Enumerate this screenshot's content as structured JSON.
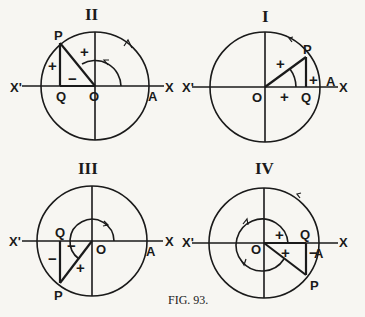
{
  "caption": "FIG. 93.",
  "diagrams": [
    {
      "quadrant": "II",
      "labels": {
        "P": "P",
        "Q": "Q",
        "O": "O",
        "A": "A",
        "X": "X",
        "Xp": "X'"
      },
      "signs": {
        "hyp": "+",
        "opp": "+",
        "adj": "−"
      }
    },
    {
      "quadrant": "I",
      "labels": {
        "P": "P",
        "Q": "Q",
        "O": "O",
        "A": "A",
        "X": "X",
        "Xp": "X'"
      },
      "signs": {
        "hyp": "+",
        "opp": "+",
        "adj": "+"
      }
    },
    {
      "quadrant": "III",
      "labels": {
        "P": "P",
        "Q": "Q",
        "O": "O",
        "A": "A",
        "X": "X",
        "Xp": "X'"
      },
      "signs": {
        "hyp": "+",
        "opp": "−",
        "adj": "−"
      }
    },
    {
      "quadrant": "IV",
      "labels": {
        "P": "P",
        "Q": "Q",
        "O": "O",
        "A": "A",
        "X": "X",
        "Xp": "X'"
      },
      "signs": {
        "hyp": "+",
        "opp": "−",
        "adj": "+"
      }
    }
  ]
}
